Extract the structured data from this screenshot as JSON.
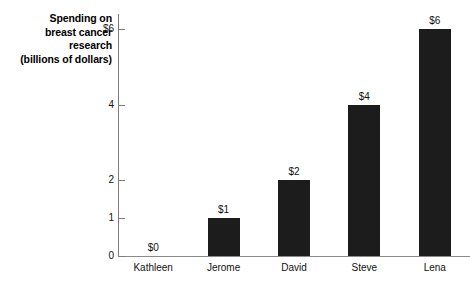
{
  "chart_data": {
    "type": "bar",
    "title": "",
    "subtitle": "",
    "xlabel": "",
    "ylabel": "Spending on breast cancer research (billions of dollars)",
    "ylabel_lines": [
      "Spending on",
      "breast cancer",
      "research",
      "(billions of dollars)"
    ],
    "categories": [
      "Kathleen",
      "Jerome",
      "David",
      "Steve",
      "Lena"
    ],
    "values": [
      0,
      1,
      2,
      4,
      6
    ],
    "value_labels": [
      "$0",
      "$1",
      "$2",
      "$4",
      "$6"
    ],
    "ytick_values": [
      0,
      1,
      2,
      4,
      6
    ],
    "ytick_labels": [
      "0",
      "1",
      "2",
      "4",
      "$6"
    ],
    "ylim": [
      0,
      6.4
    ],
    "grid": false,
    "legend": false,
    "bar_color": "#1c1c1c",
    "axis_color": "#7d7d7d",
    "text_color": "#111111"
  }
}
